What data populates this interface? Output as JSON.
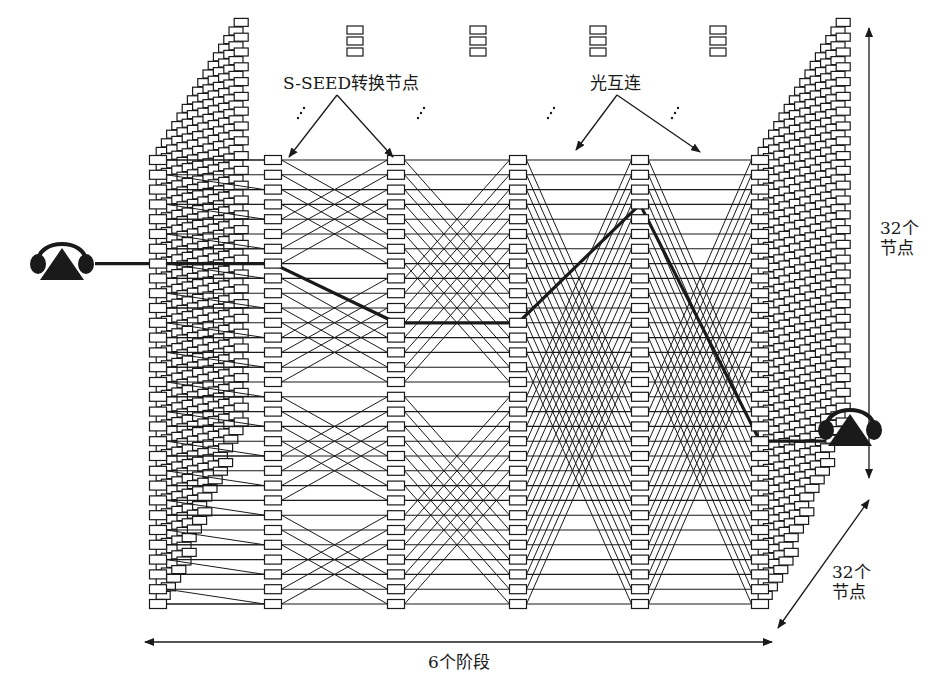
{
  "diagram": {
    "title": "",
    "labels": {
      "switch_nodes": "S-SEED转换节点",
      "optical_interconnect": "光互连",
      "vertical_count_line1": "32个",
      "vertical_count_line2": "节点",
      "depth_count_line1": "32个",
      "depth_count_line2": "节点",
      "stages": "6个阶段"
    },
    "network": {
      "stages": 6,
      "nodes_per_stage": 32,
      "planes": 32,
      "stage_x": [
        158,
        273,
        396,
        518,
        640,
        760
      ],
      "row_top_y": 160,
      "row_spacing": 14.8,
      "visible_rows": 31,
      "butterfly_spans": [
        0,
        4,
        8,
        16,
        16
      ],
      "highlight_path_rows": [
        7,
        7,
        11,
        11,
        3,
        19
      ]
    },
    "icons": [
      {
        "name": "telephone-icon-left",
        "x": 62,
        "y": 262
      },
      {
        "name": "telephone-icon-right",
        "x": 850,
        "y": 428
      }
    ],
    "colors": {
      "ink": "#1a1a1a",
      "background": "#ffffff",
      "node_fill": "#ffffff"
    }
  }
}
